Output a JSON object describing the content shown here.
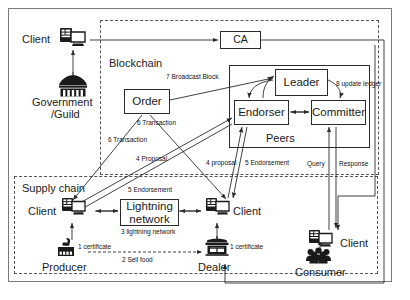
{
  "diagram": {
    "zones": [
      {
        "id": "blockchain",
        "label": "Blockchain"
      },
      {
        "id": "supplychain",
        "label": "Supply chain"
      }
    ],
    "nodes": {
      "ca": "CA",
      "order": "Order",
      "leader": "Leader",
      "endorser": "Endorser",
      "committer": "Committer",
      "peers": "Peers",
      "lightning_line1": "Lightning",
      "lightning_line2": "network"
    },
    "actors": {
      "client_top": "Client",
      "government": "Government",
      "government2": "/Guild",
      "client_producer": "Client",
      "client_dealer": "Client",
      "client_consumer": "Client",
      "producer": "Producer",
      "dealer": "Dealer",
      "consumer": "Consumer"
    },
    "icons": {
      "client": "client-computer-icon",
      "government": "government-building-icon",
      "producer": "factory-icon",
      "dealer": "shop-icon",
      "consumer": "people-group-icon"
    },
    "edge_labels": [
      {
        "id": "broadcast-block",
        "text": "7 Broadcast Block"
      },
      {
        "id": "update-ledger",
        "text": "8 update ledger"
      },
      {
        "id": "transaction-a",
        "text": "6 Transaction"
      },
      {
        "id": "transaction-b",
        "text": "6 Transaction"
      },
      {
        "id": "proposal-a",
        "text": "4 Proposal"
      },
      {
        "id": "proposal-b",
        "text": "4 proposal"
      },
      {
        "id": "endorsement-5",
        "text": "5 Endorsement"
      },
      {
        "id": "endorsement-5b",
        "text": "5 Endorsement"
      },
      {
        "id": "query",
        "text": "Query"
      },
      {
        "id": "response",
        "text": "Response"
      },
      {
        "id": "lightning-network-3",
        "text": "3 lightning network"
      },
      {
        "id": "certificate-1-producer",
        "text": "1 certificate"
      },
      {
        "id": "certificate-1-dealer",
        "text": "1 certificate"
      },
      {
        "id": "sell-food-2",
        "text": "2 Sell food"
      }
    ],
    "colors": {
      "stroke": "#2b2b2b",
      "dashed": "#555555",
      "background": "#ffffff",
      "text": "#1a1a1a"
    }
  }
}
